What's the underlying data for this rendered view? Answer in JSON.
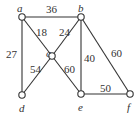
{
  "graph": {
    "vertices": [
      {
        "id": "a",
        "label": "a",
        "x": 22,
        "y": 17,
        "lx": 17,
        "ly": 12
      },
      {
        "id": "b",
        "label": "b",
        "x": 81,
        "y": 17,
        "lx": 78,
        "ly": 12
      },
      {
        "id": "c",
        "label": "c",
        "x": 52,
        "y": 56,
        "lx": 46,
        "ly": 57
      },
      {
        "id": "d",
        "label": "d",
        "x": 22,
        "y": 95,
        "lx": 19,
        "ly": 112
      },
      {
        "id": "e",
        "label": "e",
        "x": 81,
        "y": 94,
        "lx": 78,
        "ly": 111
      },
      {
        "id": "f",
        "label": "f",
        "x": 130,
        "y": 94,
        "lx": 127,
        "ly": 111
      }
    ],
    "edges": [
      {
        "from": "a",
        "to": "b",
        "weight": "36",
        "lx": 46,
        "ly": 13
      },
      {
        "from": "a",
        "to": "c",
        "weight": "18",
        "lx": 36,
        "ly": 36
      },
      {
        "from": "a",
        "to": "d",
        "weight": "27",
        "lx": 6,
        "ly": 58
      },
      {
        "from": "b",
        "to": "c",
        "weight": "24",
        "lx": 59,
        "ly": 36
      },
      {
        "from": "b",
        "to": "e",
        "weight": "40",
        "lx": 84,
        "ly": 62
      },
      {
        "from": "b",
        "to": "f",
        "weight": "60",
        "lx": 111,
        "ly": 57
      },
      {
        "from": "c",
        "to": "d",
        "weight": "54",
        "lx": 30,
        "ly": 73
      },
      {
        "from": "c",
        "to": "e",
        "weight": "60",
        "lx": 64,
        "ly": 73
      },
      {
        "from": "e",
        "to": "f",
        "weight": "50",
        "lx": 100,
        "ly": 92
      }
    ]
  }
}
